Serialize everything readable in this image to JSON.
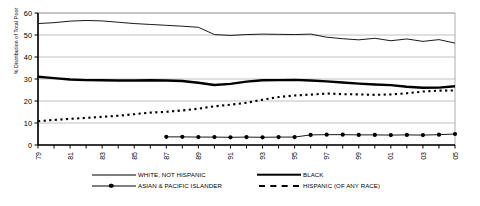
{
  "chart_data": {
    "type": "line",
    "title": "",
    "xlabel": "",
    "ylabel": "% Distribution of Total Poor",
    "ylim": [
      0,
      60
    ],
    "yticks": [
      0,
      10,
      20,
      30,
      40,
      50,
      60
    ],
    "grid": true,
    "legend_position": "bottom",
    "x": [
      1979,
      1980,
      1981,
      1982,
      1983,
      1984,
      1985,
      1986,
      1987,
      1988,
      1989,
      1990,
      1991,
      1992,
      1993,
      1994,
      1995,
      1996,
      1997,
      1998,
      1999,
      2000,
      2001,
      2002,
      2003,
      2004,
      2005
    ],
    "xtick_labels": [
      "1979",
      "1981",
      "1983",
      "1985",
      "1987",
      "1989",
      "1991",
      "1993",
      "1995",
      "1997",
      "1999",
      "2001",
      "2003",
      "2005"
    ],
    "series": [
      {
        "name": "WHITE, NOT HISPANIC",
        "style": "solid-thin",
        "values": [
          55.2,
          55.6,
          56.3,
          56.6,
          56.4,
          55.8,
          55.2,
          54.8,
          54.4,
          54.0,
          53.5,
          50.2,
          49.8,
          50.2,
          50.4,
          50.3,
          50.2,
          50.4,
          49.0,
          48.3,
          47.8,
          48.5,
          47.4,
          48.2,
          47.1,
          47.9,
          46.3
        ]
      },
      {
        "name": "BLACK",
        "style": "solid-thick",
        "values": [
          31.0,
          30.4,
          29.8,
          29.5,
          29.4,
          29.3,
          29.3,
          29.4,
          29.3,
          29.1,
          28.3,
          27.3,
          27.8,
          28.8,
          29.4,
          29.5,
          29.6,
          29.3,
          28.9,
          28.4,
          27.9,
          27.5,
          27.2,
          26.5,
          26.0,
          26.1,
          26.7
        ]
      },
      {
        "name": "ASIAN & PACIFIC ISLANDER",
        "style": "solid-marker",
        "values": [
          null,
          null,
          null,
          null,
          null,
          null,
          null,
          null,
          3.7,
          3.7,
          3.6,
          3.6,
          3.5,
          3.6,
          3.5,
          3.6,
          3.6,
          4.6,
          4.7,
          4.7,
          4.6,
          4.6,
          4.5,
          4.6,
          4.5,
          4.7,
          5.0
        ]
      },
      {
        "name": "HISPANIC (OF ANY RACE)",
        "style": "dashed",
        "values": [
          10.8,
          11.4,
          11.9,
          12.3,
          12.8,
          13.3,
          14.0,
          14.7,
          15.1,
          15.7,
          16.5,
          17.6,
          18.3,
          19.2,
          20.6,
          21.8,
          22.5,
          22.9,
          23.4,
          23.1,
          23.0,
          22.8,
          23.0,
          23.5,
          24.3,
          24.7,
          24.8
        ]
      }
    ]
  },
  "legend": {
    "items": [
      {
        "label": "WHITE, NOT HISPANIC",
        "key": "solid-thin"
      },
      {
        "label": "BLACK",
        "key": "solid-thick"
      },
      {
        "label": "ASIAN & PACIFIC ISLANDER",
        "key": "solid-marker"
      },
      {
        "label": "HISPANIC (OF ANY RACE)",
        "key": "dashed"
      }
    ]
  },
  "colors": {
    "line": "#000000",
    "grid": "#b0b0b0",
    "axis": "#000000",
    "background": "#ffffff"
  }
}
